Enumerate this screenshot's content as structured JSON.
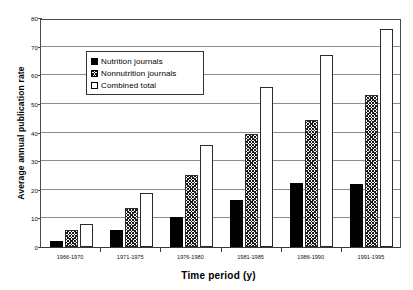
{
  "chart_data": {
    "type": "bar",
    "title": "",
    "xlabel": "Time period (y)",
    "ylabel": "Average annual publication rate",
    "categories": [
      "1966-1970",
      "1971-1975",
      "1976-1980",
      "1981-1985",
      "1986-1990",
      "1991-1995"
    ],
    "series": [
      {
        "name": "Nutrition journals",
        "values": [
          2,
          6,
          10.5,
          16.5,
          22.5,
          22
        ],
        "fill": "solid-black",
        "color": "#000000"
      },
      {
        "name": "Nonnutrition journals",
        "values": [
          6,
          13.5,
          25,
          39.5,
          44.5,
          53
        ],
        "fill": "crosshatch",
        "color": "#1a1a1a"
      },
      {
        "name": "Combined total",
        "values": [
          8,
          19,
          35.5,
          56,
          67,
          76
        ],
        "fill": "white",
        "color": "#ffffff"
      }
    ],
    "ylim": [
      0,
      80
    ],
    "yticks": [
      0,
      10,
      20,
      30,
      40,
      50,
      60,
      70,
      80
    ],
    "ytick_labels": [
      "0",
      "10",
      "20",
      "30",
      "40",
      "50",
      "60",
      "70",
      "80"
    ],
    "grid": true,
    "grid_axis": "y",
    "legend_position": "upper-left-inside"
  },
  "legend": {
    "items": [
      {
        "label": "Nutrition journals",
        "swatch": "solid-black-square-icon"
      },
      {
        "label": "Nonnutrition journals",
        "swatch": "crosshatch-square-icon"
      },
      {
        "label": "Combined total",
        "swatch": "white-square-icon"
      }
    ]
  }
}
